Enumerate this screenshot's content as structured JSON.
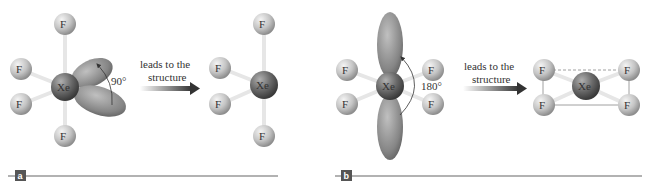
{
  "panels": [
    {
      "label": "a",
      "angle_label": "90°",
      "arrow_text_line1": "leads to the",
      "arrow_text_line2": "structure",
      "center_atom": "Xe",
      "ligand_atom": "F"
    },
    {
      "label": "b",
      "angle_label": "180°",
      "arrow_text_line1": "leads to the",
      "arrow_text_line2": "structure",
      "center_atom": "Xe",
      "ligand_atom": "F"
    }
  ],
  "colors": {
    "xenon": "#6b6b6b",
    "fluorine": "#c8c8c8",
    "lobe": "#8a8a8a",
    "rule": "#999999",
    "badge": "#555555"
  }
}
